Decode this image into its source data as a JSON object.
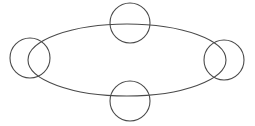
{
  "diagram": {
    "type": "ring-network",
    "background_color": "#ffffff",
    "stroke_color": "#4a4a4a",
    "stroke_width": 1.1,
    "ring": {
      "name": "ring-ellipse",
      "shape": "ellipse",
      "center_x": 127,
      "center_y": 60,
      "radius_x": 99,
      "radius_y": 36
    },
    "nodes": [
      {
        "id": "node-top",
        "name": "top-node",
        "label": "",
        "position": "top",
        "center_x": 130,
        "center_y": 23,
        "radius": 20
      },
      {
        "id": "node-right",
        "name": "right-node",
        "label": "",
        "position": "right",
        "center_x": 224,
        "center_y": 60,
        "radius": 20
      },
      {
        "id": "node-bottom",
        "name": "bottom-node",
        "label": "",
        "position": "bottom",
        "center_x": 130,
        "center_y": 101,
        "radius": 20
      },
      {
        "id": "node-left",
        "name": "left-node",
        "label": "",
        "position": "left",
        "center_x": 30,
        "center_y": 58,
        "radius": 20
      }
    ],
    "node_count": 4
  }
}
